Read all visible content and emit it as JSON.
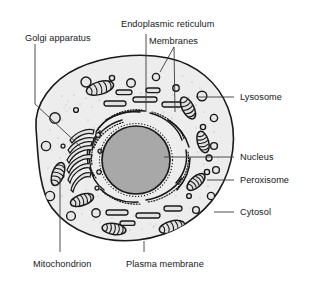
{
  "diagram": {
    "background_color": "#ffffff",
    "line_color": "#1a1a1a",
    "cytosol_fill": "#ededed",
    "nucleus_fill": "#a8a8a8",
    "organelle_fill": "#e2e2e2"
  },
  "labels": {
    "endoplasmic_reticulum": "Endoplasmic reticulum",
    "membranes": "Membranes",
    "golgi_apparatus": "Golgi apparatus",
    "lysosome": "Lysosome",
    "nucleus": "Nucleus",
    "peroxisome": "Peroxisome",
    "cytosol": "Cytosol",
    "mitochondrion": "Mitochondrion",
    "plasma_membrane": "Plasma membrane"
  }
}
